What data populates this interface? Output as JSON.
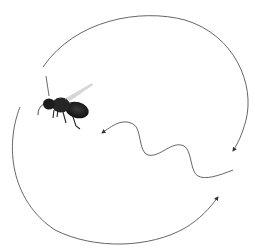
{
  "diagram": {
    "elements": [
      {
        "name": "bee",
        "description": "honeybee in flight, facing left"
      },
      {
        "name": "return-loop-top",
        "description": "clockwise arc over the top returning to the waggle run start"
      },
      {
        "name": "return-loop-bottom",
        "description": "arc under the bottom returning to the waggle run start"
      },
      {
        "name": "waggle-run",
        "description": "wavy line pointing toward upper-left"
      }
    ],
    "colors": {
      "line": "#555555",
      "bee_dark": "#1a1a1a",
      "bee_wing": "#c8c8c8",
      "background": "#ffffff"
    }
  }
}
